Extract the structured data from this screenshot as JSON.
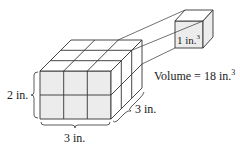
{
  "diagram": {
    "large_prism": {
      "length": "3 in.",
      "height": "2 in.",
      "depth": "3 in."
    },
    "unit_cube": {
      "label": "1 in.",
      "exponent": "3"
    },
    "volume": {
      "text": "Volume = 18 in.",
      "exponent": "3"
    },
    "labels": {
      "height": "2 in.",
      "width": "3 in.",
      "depth": "3 in."
    },
    "colors": {
      "face": "#ebebeb",
      "line": "#333333"
    }
  }
}
